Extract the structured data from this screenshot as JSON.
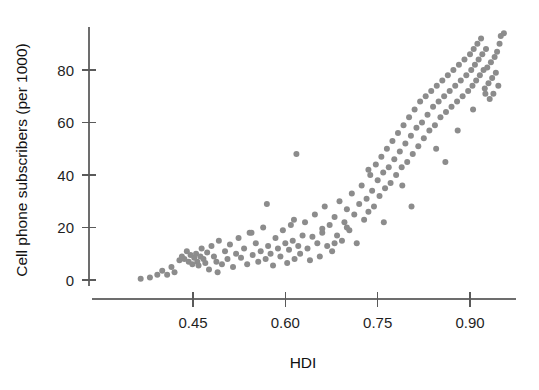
{
  "figure": {
    "background_color": "#ffffff",
    "top_cropped_artifact": "~ ~",
    "point_color": "#8c8c8c",
    "axis_color": "#6d6d6d",
    "text_color": "#1f1f1f"
  },
  "chart_data": {
    "type": "scatter",
    "title": "",
    "subtitle": "",
    "xlabel": "HDI",
    "ylabel": "Cell phone subscribers (per 1000)",
    "xlim": [
      0.345,
      0.975
    ],
    "ylim": [
      -4,
      98
    ],
    "xticks": [
      0.45,
      0.6,
      0.75,
      0.9
    ],
    "xtick_labels": [
      "0.45",
      "0.60",
      "0.75",
      "0.90"
    ],
    "yticks": [
      0,
      20,
      40,
      60,
      80
    ],
    "ytick_labels": [
      "0",
      "20",
      "40",
      "60",
      "80"
    ],
    "grid": false,
    "legend": null,
    "marker": {
      "shape": "circle",
      "size_px": 6,
      "color": "#8c8c8c",
      "opacity": 1
    },
    "series": [
      {
        "name": "Countries",
        "x": [
          0.365,
          0.38,
          0.392,
          0.4,
          0.408,
          0.415,
          0.42,
          0.428,
          0.432,
          0.436,
          0.44,
          0.443,
          0.446,
          0.449,
          0.452,
          0.455,
          0.457,
          0.459,
          0.462,
          0.464,
          0.467,
          0.47,
          0.473,
          0.476,
          0.48,
          0.484,
          0.488,
          0.492,
          0.497,
          0.502,
          0.506,
          0.51,
          0.515,
          0.52,
          0.524,
          0.528,
          0.533,
          0.538,
          0.542,
          0.547,
          0.552,
          0.556,
          0.56,
          0.564,
          0.568,
          0.572,
          0.576,
          0.58,
          0.584,
          0.588,
          0.592,
          0.596,
          0.6,
          0.603,
          0.606,
          0.609,
          0.612,
          0.615,
          0.618,
          0.621,
          0.624,
          0.628,
          0.632,
          0.636,
          0.64,
          0.644,
          0.648,
          0.652,
          0.656,
          0.66,
          0.664,
          0.668,
          0.672,
          0.676,
          0.68,
          0.684,
          0.688,
          0.692,
          0.696,
          0.7,
          0.704,
          0.708,
          0.712,
          0.716,
          0.72,
          0.724,
          0.728,
          0.732,
          0.735,
          0.738,
          0.741,
          0.744,
          0.747,
          0.75,
          0.753,
          0.756,
          0.759,
          0.762,
          0.765,
          0.768,
          0.771,
          0.774,
          0.777,
          0.78,
          0.783,
          0.786,
          0.789,
          0.792,
          0.795,
          0.798,
          0.801,
          0.804,
          0.807,
          0.81,
          0.813,
          0.816,
          0.819,
          0.822,
          0.825,
          0.828,
          0.831,
          0.834,
          0.837,
          0.84,
          0.843,
          0.846,
          0.849,
          0.852,
          0.855,
          0.858,
          0.861,
          0.864,
          0.867,
          0.87,
          0.873,
          0.876,
          0.879,
          0.882,
          0.885,
          0.888,
          0.891,
          0.894,
          0.897,
          0.9,
          0.902,
          0.904,
          0.906,
          0.908,
          0.91,
          0.912,
          0.914,
          0.916,
          0.918,
          0.92,
          0.922,
          0.924,
          0.926,
          0.928,
          0.93,
          0.932,
          0.934,
          0.936,
          0.938,
          0.94,
          0.942,
          0.944,
          0.946,
          0.948,
          0.95,
          0.955,
          0.57,
          0.614,
          0.545,
          0.49,
          0.66,
          0.7,
          0.76,
          0.805,
          0.86,
          0.905,
          0.68,
          0.735,
          0.79,
          0.845,
          0.88,
          0.925
        ],
        "y": [
          0.5,
          1.0,
          2.0,
          3.5,
          2.0,
          5.0,
          3.0,
          7.5,
          9.0,
          8.0,
          11.0,
          7.0,
          9.5,
          6.0,
          8.5,
          10.0,
          7.0,
          5.5,
          9.0,
          12.0,
          8.0,
          6.5,
          10.5,
          4.0,
          13.0,
          9.0,
          7.0,
          15.0,
          6.0,
          11.0,
          8.0,
          13.5,
          5.0,
          10.0,
          16.0,
          8.5,
          12.0,
          6.0,
          18.0,
          9.5,
          14.0,
          7.0,
          11.0,
          20.0,
          8.0,
          13.0,
          10.0,
          5.5,
          16.0,
          12.0,
          9.0,
          19.0,
          14.0,
          6.5,
          11.5,
          21.0,
          15.0,
          8.0,
          48.0,
          13.0,
          10.0,
          17.0,
          22.0,
          12.0,
          7.5,
          16.5,
          25.0,
          14.0,
          9.0,
          19.5,
          28.0,
          13.0,
          21.0,
          11.0,
          24.0,
          17.0,
          30.0,
          15.0,
          22.0,
          27.0,
          19.0,
          33.0,
          25.0,
          14.0,
          29.0,
          36.0,
          23.0,
          31.0,
          26.0,
          40.0,
          34.0,
          28.0,
          44.0,
          38.0,
          32.0,
          47.0,
          41.0,
          35.0,
          50.0,
          43.0,
          37.0,
          53.0,
          46.0,
          40.0,
          56.0,
          49.0,
          43.0,
          59.0,
          52.0,
          45.0,
          62.0,
          55.0,
          48.0,
          65.0,
          58.0,
          51.0,
          68.0,
          60.0,
          54.0,
          70.0,
          63.0,
          57.0,
          72.0,
          66.0,
          59.0,
          74.0,
          68.0,
          62.0,
          76.0,
          70.0,
          64.0,
          78.0,
          72.0,
          66.0,
          80.0,
          74.0,
          68.0,
          82.0,
          76.0,
          70.0,
          84.0,
          78.0,
          72.0,
          86.0,
          80.0,
          74.0,
          88.0,
          82.0,
          76.0,
          90.0,
          84.0,
          78.0,
          92.0,
          86.0,
          80.0,
          73.0,
          88.0,
          81.0,
          75.0,
          69.0,
          83.0,
          77.0,
          71.0,
          85.0,
          79.0,
          87.0,
          74.0,
          90.0,
          93.0,
          94.0,
          29.0,
          23.0,
          18.0,
          3.0,
          18.0,
          20.0,
          22.0,
          28.0,
          45.0,
          65.0,
          14.0,
          42.0,
          36.0,
          50.0,
          57.0,
          71.0
        ]
      }
    ]
  }
}
